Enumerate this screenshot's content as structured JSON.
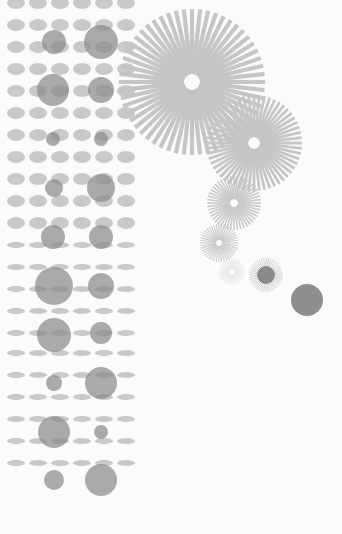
{
  "colors": {
    "background": "#fbfbfa",
    "ellipse": "#c9c9c7",
    "circle": "#8a8a88",
    "ray": "#c4c4c2",
    "solid_dot": "#8e8e8c"
  },
  "dot_grid": {
    "columns_x": [
      16,
      38,
      60,
      82,
      104,
      126
    ],
    "rows_y": [
      3,
      25,
      47,
      69,
      91,
      113,
      135,
      157,
      179,
      201,
      223,
      245,
      267,
      289,
      311,
      333,
      353,
      375,
      397,
      419,
      441,
      463
    ],
    "ellipse_rx": 9,
    "ellipse_ry": 6
  },
  "circles": [
    {
      "cx": 54,
      "cy": 42,
      "r": 12
    },
    {
      "cx": 101,
      "cy": 42,
      "r": 17
    },
    {
      "cx": 53,
      "cy": 90,
      "r": 16
    },
    {
      "cx": 101,
      "cy": 90,
      "r": 13
    },
    {
      "cx": 53,
      "cy": 139,
      "r": 7
    },
    {
      "cx": 101,
      "cy": 139,
      "r": 7
    },
    {
      "cx": 54,
      "cy": 188,
      "r": 9
    },
    {
      "cx": 101,
      "cy": 188,
      "r": 14
    },
    {
      "cx": 53,
      "cy": 237,
      "r": 12
    },
    {
      "cx": 101,
      "cy": 237,
      "r": 12
    },
    {
      "cx": 54,
      "cy": 286,
      "r": 19
    },
    {
      "cx": 101,
      "cy": 286,
      "r": 13
    },
    {
      "cx": 54,
      "cy": 335,
      "r": 17
    },
    {
      "cx": 101,
      "cy": 333,
      "r": 11
    },
    {
      "cx": 54,
      "cy": 383,
      "r": 8
    },
    {
      "cx": 101,
      "cy": 383,
      "r": 16
    },
    {
      "cx": 54,
      "cy": 432,
      "r": 16
    },
    {
      "cx": 101,
      "cy": 432,
      "r": 7
    },
    {
      "cx": 54,
      "cy": 480,
      "r": 10
    },
    {
      "cx": 101,
      "cy": 480,
      "r": 16
    }
  ],
  "sunbursts": [
    {
      "cx": 192,
      "cy": 82,
      "r": 73,
      "inner": 8,
      "rays": 56,
      "width": 4.2,
      "opacity": 0.95
    },
    {
      "cx": 254,
      "cy": 143,
      "r": 48,
      "inner": 6,
      "rays": 56,
      "width": 2.8,
      "opacity": 0.95
    },
    {
      "cx": 234,
      "cy": 203,
      "r": 27,
      "inner": 4,
      "rays": 48,
      "width": 1.6,
      "opacity": 0.9
    },
    {
      "cx": 219,
      "cy": 243,
      "r": 19,
      "inner": 3,
      "rays": 44,
      "width": 1.1,
      "opacity": 0.85
    },
    {
      "cx": 232,
      "cy": 272,
      "r": 13,
      "inner": 3,
      "rays": 36,
      "width": 1.0,
      "opacity": 0.35
    },
    {
      "cx": 266,
      "cy": 275,
      "r": 17,
      "inner": 9,
      "rays": 44,
      "width": 1.0,
      "opacity": 0.75
    }
  ],
  "sunburst_cores": [
    {
      "cx": 266,
      "cy": 275,
      "r": 9
    }
  ],
  "solid_dots": [
    {
      "cx": 307,
      "cy": 300,
      "r": 16
    }
  ]
}
